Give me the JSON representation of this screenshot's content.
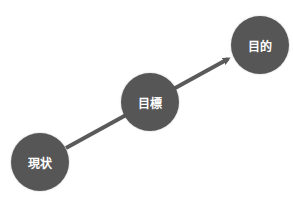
{
  "diagram": {
    "type": "progression-arrow",
    "nodes": [
      {
        "id": "current",
        "label": "現状",
        "cx": 40,
        "cy": 162
      },
      {
        "id": "goal",
        "label": "目標",
        "cx": 150,
        "cy": 102
      },
      {
        "id": "purpose",
        "label": "目的",
        "cx": 260,
        "cy": 45
      }
    ],
    "colors": {
      "node": "#565656",
      "arrow": "#5a5a5a",
      "text": "#ffffff"
    }
  }
}
